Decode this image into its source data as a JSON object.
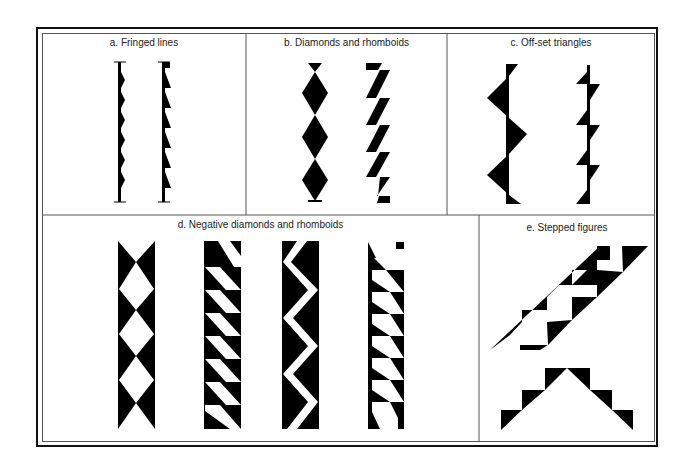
{
  "figure": {
    "panels": [
      {
        "id": "a",
        "label": "a. Fringed lines"
      },
      {
        "id": "b",
        "label": "b. Diamonds and rhomboids"
      },
      {
        "id": "c",
        "label": "c. Off-set triangles"
      },
      {
        "id": "d",
        "label": "d. Negative diamonds and rhomboids"
      },
      {
        "id": "e",
        "label": "e. Stepped figures"
      }
    ]
  },
  "colors": {
    "ink": "#000000",
    "paper": "#ffffff",
    "rule": "#555555"
  }
}
